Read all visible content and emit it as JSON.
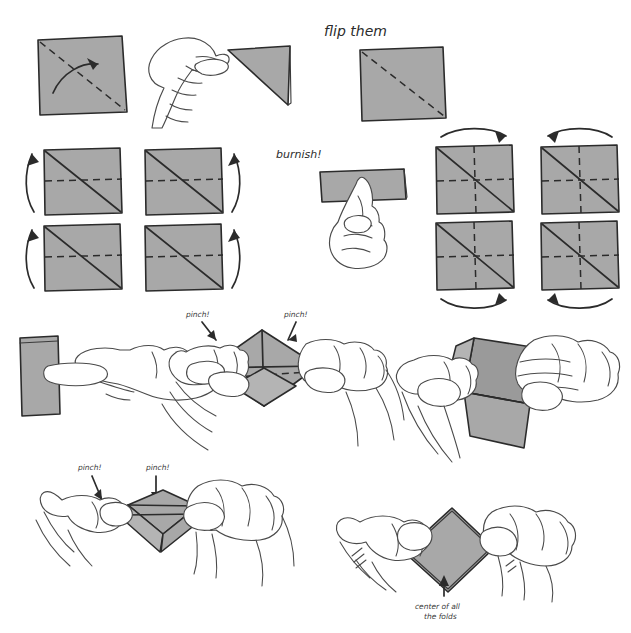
{
  "page": {
    "background_color": "#ffffff",
    "ink_color": "#2b2b2b",
    "paper_color": "#a8a8a8",
    "width": 631,
    "height": 633
  },
  "annotations": {
    "flip_them": "flip them",
    "burnish": "burnish!",
    "pinch_1": "pinch!",
    "pinch_2": "pinch!",
    "pinch_3": "pinch!",
    "pinch_4": "pinch!",
    "center_line_1": "center of all",
    "center_line_2": "the folds"
  },
  "steps": [
    {
      "id": "step-1-diagonal-fold",
      "label": "square with diagonal crease and curved fold arrow"
    },
    {
      "id": "step-2-hand-triangle",
      "label": "hand holding folded triangle"
    },
    {
      "id": "step-3-flipped-square",
      "label": "flipped square with dashed diagonal"
    },
    {
      "id": "step-4-grid-left",
      "label": "four squares with diagonal and horizontal crease, vertical arrows"
    },
    {
      "id": "step-5-burnish-hand",
      "label": "hand burnishing folded strip"
    },
    {
      "id": "step-6-grid-right",
      "label": "four squares with diagonal, horizontal and vertical creases, horizontal arrows"
    },
    {
      "id": "step-7-strip-hand",
      "label": "hand creasing vertical folded strip"
    },
    {
      "id": "step-8-pinch-open",
      "label": "two hands pinching opened square along creases"
    },
    {
      "id": "step-9-collapse",
      "label": "two hands collapsing the folded form"
    },
    {
      "id": "step-10-pinch-flat",
      "label": "two hands pinching flattened diamond"
    },
    {
      "id": "step-11-finished",
      "label": "two hands holding finished diamond, arrow marks center of all the folds"
    }
  ]
}
